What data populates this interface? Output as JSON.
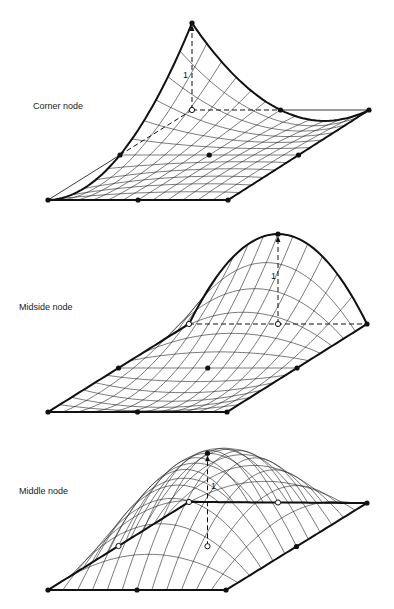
{
  "figure": {
    "panels": [
      {
        "id": "corner",
        "label": "Corner node",
        "peak_value_label": "1",
        "shape_function": "corner",
        "peak_node": "back-left",
        "nodes": [
          {
            "name": "bottom-left",
            "type": "filled"
          },
          {
            "name": "bottom-mid",
            "type": "filled"
          },
          {
            "name": "bottom-right",
            "type": "filled"
          },
          {
            "name": "right-mid",
            "type": "filled"
          },
          {
            "name": "back-right",
            "type": "filled"
          },
          {
            "name": "back-mid",
            "type": "filled"
          },
          {
            "name": "back-left",
            "type": "open"
          },
          {
            "name": "left-mid",
            "type": "filled"
          },
          {
            "name": "center",
            "type": "filled"
          }
        ]
      },
      {
        "id": "midside",
        "label": "Midside node",
        "peak_value_label": "1",
        "shape_function": "midside",
        "peak_node": "back-mid",
        "nodes": [
          {
            "name": "bottom-left",
            "type": "filled"
          },
          {
            "name": "bottom-mid",
            "type": "filled"
          },
          {
            "name": "bottom-right",
            "type": "filled"
          },
          {
            "name": "right-mid",
            "type": "filled"
          },
          {
            "name": "back-right",
            "type": "filled"
          },
          {
            "name": "back-mid",
            "type": "open"
          },
          {
            "name": "back-left",
            "type": "open"
          },
          {
            "name": "left-mid",
            "type": "filled"
          },
          {
            "name": "center",
            "type": "filled"
          }
        ]
      },
      {
        "id": "middle",
        "label": "Middle node",
        "peak_value_label": "1",
        "shape_function": "middle",
        "peak_node": "center",
        "nodes": [
          {
            "name": "bottom-left",
            "type": "filled"
          },
          {
            "name": "bottom-mid",
            "type": "filled"
          },
          {
            "name": "bottom-right",
            "type": "filled"
          },
          {
            "name": "right-mid",
            "type": "filled"
          },
          {
            "name": "back-right",
            "type": "filled"
          },
          {
            "name": "back-mid",
            "type": "open"
          },
          {
            "name": "back-left",
            "type": "open"
          },
          {
            "name": "left-mid",
            "type": "open"
          },
          {
            "name": "center",
            "type": "open"
          }
        ]
      }
    ]
  }
}
